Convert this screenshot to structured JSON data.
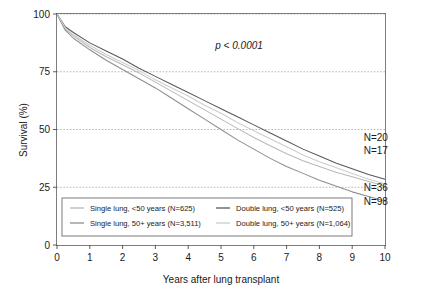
{
  "chart_data": {
    "type": "line",
    "title": "",
    "xlabel": "Years after lung transplant",
    "ylabel": "Survival (%)",
    "xlim": [
      0,
      10
    ],
    "ylim": [
      0,
      100
    ],
    "xticks": [
      "0",
      "1",
      "2",
      "3",
      "4",
      "5",
      "6",
      "7",
      "8",
      "9",
      "10"
    ],
    "yticks": [
      "0",
      "25",
      "50",
      "75",
      "100"
    ],
    "grid": "horizontal",
    "legend_position": "bottom-inside",
    "annotations": [
      {
        "name": "p-value",
        "text": "p < 0.0001",
        "x": 5.55,
        "y": 85
      },
      {
        "name": "n-label-20",
        "text": "N=20",
        "x": 9.35,
        "y": 45
      },
      {
        "name": "n-label-17",
        "text": "N=17",
        "x": 9.35,
        "y": 39.5
      },
      {
        "name": "n-label-36",
        "text": "N=36",
        "x": 9.35,
        "y": 23.5
      },
      {
        "name": "n-label-98",
        "text": "N=98",
        "x": 9.35,
        "y": 17.5
      }
    ],
    "series": [
      {
        "name": "Single lung, <50 years",
        "legend_label": "Single lung, <50 years  (N=625)",
        "n": 625,
        "color": "#b9b9b9",
        "x": [
          0,
          0.25,
          0.5,
          1,
          1.5,
          2,
          2.5,
          3,
          3.5,
          4,
          4.5,
          5,
          5.5,
          6,
          6.5,
          7,
          7.5,
          8,
          8.5,
          9,
          9.5,
          10
        ],
        "values": [
          100,
          93.5,
          90.5,
          85.5,
          81.5,
          78.0,
          74.5,
          70.5,
          66.5,
          62.5,
          58.5,
          54.5,
          50.5,
          46.5,
          43.0,
          39.5,
          36.5,
          34.0,
          31.5,
          29.5,
          27.5,
          25.5
        ]
      },
      {
        "name": "Single lung, 50+ years",
        "legend_label": "Single lung, 50+ years  (N=3,511)",
        "n": 3511,
        "color": "#8e8e8e",
        "x": [
          0,
          0.25,
          0.5,
          1,
          1.5,
          2,
          2.5,
          3,
          3.5,
          4,
          4.5,
          5,
          5.5,
          6,
          6.5,
          7,
          7.5,
          8,
          8.5,
          9,
          9.5,
          10
        ],
        "values": [
          100,
          93.0,
          89.5,
          84.5,
          80.0,
          76.0,
          72.0,
          68.0,
          63.5,
          59.0,
          54.5,
          50.0,
          45.5,
          41.5,
          37.5,
          34.0,
          31.0,
          28.0,
          25.5,
          23.0,
          21.0,
          19.0
        ]
      },
      {
        "name": "Double lung, <50 years",
        "legend_label": "Double lung, <50 years  (N=525)",
        "n": 525,
        "color": "#58585a",
        "x": [
          0,
          0.25,
          0.5,
          1,
          1.5,
          2,
          2.5,
          3,
          3.5,
          4,
          4.5,
          5,
          5.5,
          6,
          6.5,
          7,
          7.5,
          8,
          8.5,
          9,
          9.5,
          10
        ],
        "values": [
          100,
          94.5,
          92.0,
          87.5,
          84.0,
          80.5,
          76.5,
          73.0,
          69.5,
          66.0,
          62.5,
          59.0,
          55.5,
          52.0,
          48.5,
          45.0,
          41.5,
          38.5,
          35.5,
          33.0,
          30.5,
          28.5
        ]
      },
      {
        "name": "Double lung, 50+ years",
        "legend_label": "Double lung, 50+ years  (N=1,064)",
        "n": 1064,
        "color": "#cdcdcd",
        "x": [
          0,
          0.25,
          0.5,
          1,
          1.5,
          2,
          2.5,
          3,
          3.5,
          4,
          4.5,
          5,
          5.5,
          6,
          6.5,
          7,
          7.5,
          8,
          8.5,
          9,
          9.5,
          10
        ],
        "values": [
          100,
          94.0,
          91.0,
          86.5,
          82.5,
          79.0,
          75.5,
          71.5,
          68.0,
          64.5,
          60.5,
          57.0,
          53.0,
          49.5,
          46.0,
          42.5,
          39.0,
          36.0,
          33.5,
          31.0,
          28.5,
          26.5
        ]
      }
    ]
  }
}
